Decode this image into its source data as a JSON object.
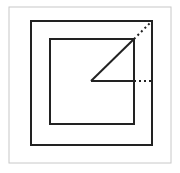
{
  "diagram": {
    "colors": {
      "frame": "#c8c8c8",
      "stroke": "#222222",
      "background": "#ffffff"
    },
    "frame": {
      "x": 9,
      "y": 7,
      "w": 162,
      "h": 156
    },
    "outer_square": {
      "x": 31,
      "y": 21,
      "w": 121,
      "h": 124
    },
    "inner_square": {
      "x": 50,
      "y": 39,
      "w": 84,
      "h": 85
    },
    "center": {
      "x": 91,
      "y": 81
    },
    "diagonal": {
      "x1": 91,
      "y1": 81,
      "x2": 134,
      "y2": 39
    },
    "diagonal_dotted": {
      "x1": 134,
      "y1": 39,
      "x2": 152,
      "y2": 21
    },
    "horizontal": {
      "x1": 91,
      "y1": 81,
      "x2": 134,
      "y2": 81
    },
    "horizontal_dotted": {
      "x1": 134,
      "y1": 81,
      "x2": 152,
      "y2": 81
    }
  }
}
